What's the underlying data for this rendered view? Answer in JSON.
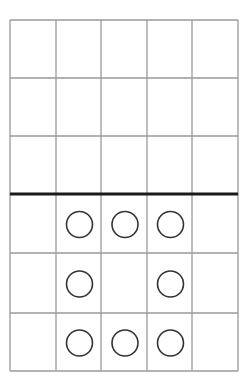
{
  "diagram": {
    "type": "grid-with-circles",
    "grid": {
      "columns": 5,
      "rows": 6,
      "col_lines_x": [
        10,
        56,
        101,
        147,
        192,
        238
      ],
      "row_lines_y": [
        20,
        78,
        136,
        194,
        253,
        313,
        371
      ],
      "line_color": "#9a9a9a",
      "divider": {
        "after_row": 3,
        "y": 194,
        "color": "#1a1a1a",
        "thickness": 3
      }
    },
    "circles": {
      "radius": 13,
      "stroke": "#333333",
      "stroke_width": 1.6,
      "fill": "none",
      "cells": [
        {
          "row": 4,
          "col": 2
        },
        {
          "row": 4,
          "col": 3
        },
        {
          "row": 4,
          "col": 4
        },
        {
          "row": 5,
          "col": 2
        },
        {
          "row": 5,
          "col": 4
        },
        {
          "row": 6,
          "col": 2
        },
        {
          "row": 6,
          "col": 3
        },
        {
          "row": 6,
          "col": 4
        }
      ]
    }
  }
}
